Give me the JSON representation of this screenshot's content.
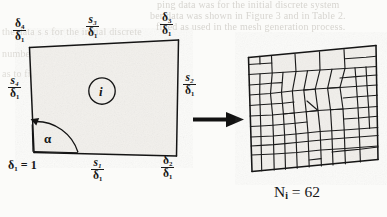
{
  "figure": {
    "title_absent": true,
    "left_panel": {
      "name": "reference-element",
      "interior_label": "i",
      "base_label": "δ₁ = 1",
      "angle_label": "α",
      "edge_labels": {
        "top_left_corner": {
          "num": "δ₄",
          "den": "δ₁"
        },
        "top_middle": {
          "num": "s₃",
          "den": "δ₁"
        },
        "top_right_corner": {
          "num": "δ₃",
          "den": "δ₁"
        },
        "left_middle": {
          "num": "s₄",
          "den": "δ₁"
        },
        "right_middle": {
          "num": "s₂",
          "den": "δ₁"
        },
        "bottom_middle": {
          "num": "s₁",
          "den": "δ₁"
        },
        "bottom_right_corner": {
          "num": "δ₂",
          "den": "δ₁"
        }
      }
    },
    "arrow": {
      "name": "maps-to-arrow",
      "direction": "right"
    },
    "right_panel": {
      "name": "generated-quad-mesh",
      "caption_symbol": "N",
      "caption_subscript": "i",
      "caption_equals": "=",
      "caption_value": "62",
      "caption_full": "Nᵢ = 62"
    },
    "colors": {
      "ink": "#1a1a1a",
      "paper": "#fbfbf9",
      "bleed_text": "#c9c6c0"
    }
  },
  "bleed_through": {
    "line1": "ping data was for the initial discrete system",
    "line2": "ber data was shown in Figure 3 and in Table 2.",
    "line3": "fined as used in the mesh generation process.",
    "line4": "the data  s  s  for the initial discrete",
    "line5": "number shown in Table 2 and in Table 3",
    "line6": "as to field algorithms used"
  }
}
